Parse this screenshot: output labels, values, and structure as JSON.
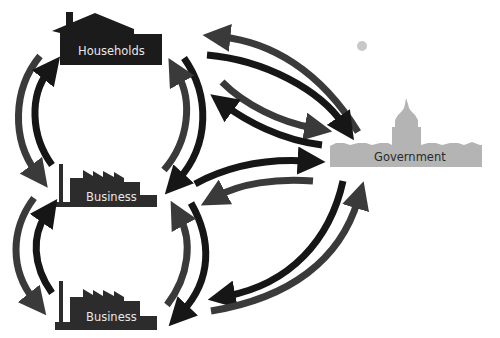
{
  "nodes": {
    "households": {
      "label": "Households",
      "shape": "house-icon",
      "color": "#1b1b1b"
    },
    "business_top": {
      "label": "Business",
      "shape": "factory-icon",
      "color": "#2c2c2c"
    },
    "business_bottom": {
      "label": "Business",
      "shape": "factory-icon",
      "color": "#2c2c2c"
    },
    "government": {
      "label": "Government",
      "shape": "capitol-icon",
      "color": "#b4b4b4"
    }
  },
  "colors": {
    "arrow_dark": "#161616",
    "arrow_gray": "#3a3a3a",
    "background": "#ffffff",
    "dot": "#c8c8c8"
  },
  "flows": [
    {
      "from": "households",
      "to": "business_top",
      "side": "left-outer"
    },
    {
      "from": "business_top",
      "to": "households",
      "side": "left-inner"
    },
    {
      "from": "households",
      "to": "business_top",
      "side": "right-outer"
    },
    {
      "from": "business_top",
      "to": "households",
      "side": "right-inner"
    },
    {
      "from": "business_top",
      "to": "business_bottom",
      "side": "left-outer"
    },
    {
      "from": "business_bottom",
      "to": "business_top",
      "side": "left-inner"
    },
    {
      "from": "business_top",
      "to": "business_bottom",
      "side": "right-outer"
    },
    {
      "from": "business_bottom",
      "to": "business_top",
      "side": "right-inner"
    },
    {
      "from": "government",
      "to": "households",
      "side": "upper"
    },
    {
      "from": "households",
      "to": "government",
      "side": "upper"
    },
    {
      "from": "households",
      "to": "government",
      "side": "lower"
    },
    {
      "from": "government",
      "to": "households",
      "side": "lower"
    },
    {
      "from": "business_top",
      "to": "government"
    },
    {
      "from": "government",
      "to": "business_top"
    },
    {
      "from": "government",
      "to": "business_bottom"
    },
    {
      "from": "business_bottom",
      "to": "government"
    }
  ]
}
